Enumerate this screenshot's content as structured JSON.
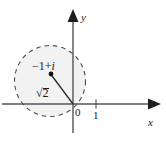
{
  "figure": {
    "background_color": "#ffffff",
    "axis_color": "#555555",
    "circle_stroke_color": "#4d4d4d",
    "circle_fill_color": "#f2f2f2",
    "point_color": "#111111",
    "text_color": "#1a1a1a"
  },
  "axes": {
    "x_label": "x",
    "y_label": "y",
    "origin_label": "0",
    "x_tick_labels": [
      "1"
    ]
  },
  "annotations": {
    "center_point_label_sign": "−1",
    "center_point_label_plus": "+",
    "center_point_label_imag": "i",
    "center_point_label_full": "−1 + i",
    "radius_label_radical": "√",
    "radius_label_value": "2",
    "radius_label_full": "√2"
  },
  "geometry": {
    "origin_x": 73,
    "origin_y": 104,
    "unit_px": 23,
    "center_x": -1,
    "center_y": 1,
    "radius_units": 1.414,
    "radius_px": 35.5,
    "circle_dashed": true,
    "point_marker_radius_px": 2.4
  }
}
